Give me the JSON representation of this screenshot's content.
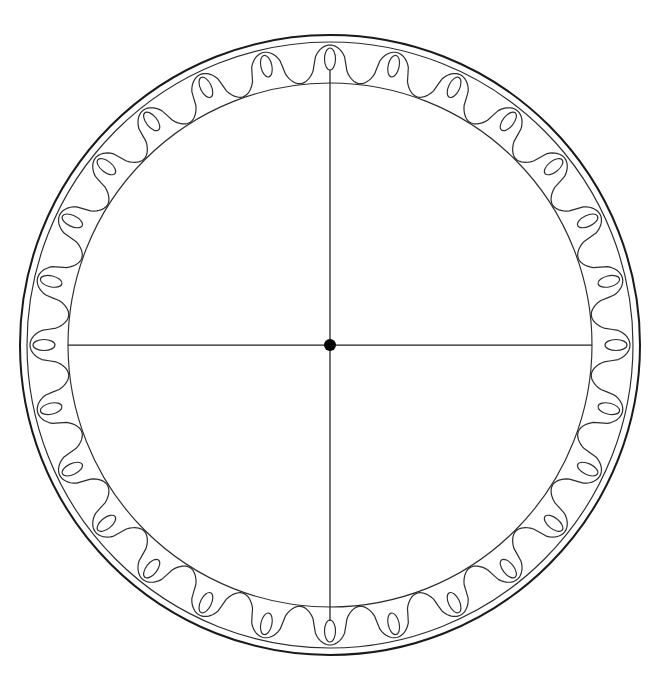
{
  "figure": {
    "background_color": "#ffffff",
    "line_color": "#2b2b2b",
    "outline_color": "#1a1a1a",
    "hub_color": "#000000"
  },
  "geometry": {
    "canvas_width": 653,
    "canvas_height": 685,
    "center_x": 330,
    "center_y": 345,
    "outer_circle_radius": 310,
    "outer_circle_radius_inner_edge": 303,
    "inner_circle_radius": 262,
    "ring_thickness": 48,
    "lobe_count": 28,
    "lobe_angular_pitch_deg": 12.857,
    "wave_peak_radius": 300,
    "wave_trough_radius": 263,
    "phase_offset_deg": 0,
    "hub_radius": 6
  },
  "ornaments": {
    "oval_count": 28,
    "oval_center_radius": 286,
    "oval_semi_major": 11,
    "oval_semi_minor": 5.5,
    "oval_orientation": "radial"
  },
  "axes": {
    "vertical_diameter_label": "vertical diameter",
    "horizontal_diameter_label": "horizontal diameter",
    "vertical_top_y": 70,
    "vertical_bottom_y": 621,
    "horizontal_left_x": 68,
    "horizontal_right_x": 592
  },
  "chart_data": {
    "type": "line",
    "xlabel": "angle (degrees)",
    "ylabel": "radius (px)",
    "grid": false,
    "legend": "none",
    "polar": true,
    "xlim": [
      0,
      360
    ],
    "ylim": [
      0,
      310
    ],
    "series": [
      {
        "name": "outer circle",
        "kind": "circle",
        "radius": 310,
        "values": [
          310
        ]
      },
      {
        "name": "outer circle inner edge",
        "kind": "circle",
        "radius": 303,
        "values": [
          303
        ]
      },
      {
        "name": "inner circle",
        "kind": "circle",
        "radius": 262,
        "values": [
          262
        ]
      },
      {
        "name": "scalloped wave",
        "kind": "wave",
        "lobes": 28,
        "peak_radius": 300,
        "trough_radius": 263,
        "values": [
          300,
          263,
          300,
          263,
          300,
          263,
          300,
          263,
          300,
          263,
          300,
          263,
          300,
          263,
          300,
          263,
          300,
          263,
          300,
          263,
          300,
          263,
          300,
          263,
          300,
          263,
          300,
          263
        ]
      },
      {
        "name": "oval motifs",
        "kind": "scatter",
        "count": 28,
        "radius": 286,
        "values": [
          286,
          286,
          286,
          286,
          286,
          286,
          286,
          286,
          286,
          286,
          286,
          286,
          286,
          286,
          286,
          286,
          286,
          286,
          286,
          286,
          286,
          286,
          286,
          286,
          286,
          286,
          286,
          286
        ]
      }
    ],
    "annotations": [
      {
        "name": "centre dot",
        "x": 330,
        "y": 345,
        "radius": 6
      },
      {
        "name": "vertical diameter",
        "from": [
          330,
          70
        ],
        "to": [
          330,
          621
        ]
      },
      {
        "name": "horizontal diameter",
        "from": [
          68,
          345
        ],
        "to": [
          592,
          345
        ]
      }
    ]
  }
}
